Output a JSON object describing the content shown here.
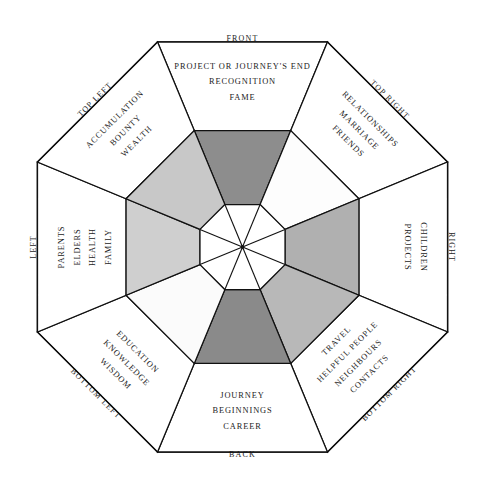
{
  "diagram": {
    "shape": "octagon",
    "sectors": [
      {
        "id": "front",
        "direction_label": "FRONT",
        "keywords": [
          "PROJECT OR JOURNEY'S END",
          "RECOGNITION",
          "FAME"
        ],
        "inner_fill": "#8d8d8d",
        "rotation": 0
      },
      {
        "id": "top-right",
        "direction_label": "TOP RIGHT",
        "keywords": [
          "RELATIONSHIPS",
          "MARRIAGE",
          "FRIENDS"
        ],
        "inner_fill": "#fdfdfd",
        "rotation": 45
      },
      {
        "id": "right",
        "direction_label": "RIGHT",
        "keywords": [
          "CHILDREN",
          "PROJECTS"
        ],
        "inner_fill": "#b0b0b0",
        "rotation": 90
      },
      {
        "id": "bottom-right",
        "direction_label": "BOTTOM RIGHT",
        "keywords": [
          "CONTACTS",
          "NEIGHBOURS",
          "HELPFUL PEOPLE",
          "TRAVEL"
        ],
        "inner_fill": "#b8b8b8",
        "rotation": 135
      },
      {
        "id": "back",
        "direction_label": "BACK",
        "keywords": [
          "CAREER",
          "BEGINNINGS",
          "JOURNEY"
        ],
        "inner_fill": "#8a8a8a",
        "rotation": 180
      },
      {
        "id": "bottom-left",
        "direction_label": "BOTTOM LEFT",
        "keywords": [
          "WISDOM",
          "KNOWLEDGE",
          "EDUCATION"
        ],
        "inner_fill": "#fbfbfb",
        "rotation": 225
      },
      {
        "id": "left",
        "direction_label": "LEFT",
        "keywords": [
          "PARENTS",
          "ELDERS",
          "HEALTH",
          "FAMILY"
        ],
        "inner_fill": "#cfcfcf",
        "rotation": 270
      },
      {
        "id": "top-left",
        "direction_label": "TOP LEFT",
        "keywords": [
          "ACCUMULATION",
          "BOUNTY",
          "WEALTH"
        ],
        "inner_fill": "#c8c8c8",
        "rotation": 315
      }
    ],
    "core": {
      "fill": "#ffffff",
      "has_radial_spokes": true,
      "spoke_count": 8
    },
    "palette": {
      "line": "#111111",
      "text": "#232323",
      "background": "#ffffff"
    }
  }
}
